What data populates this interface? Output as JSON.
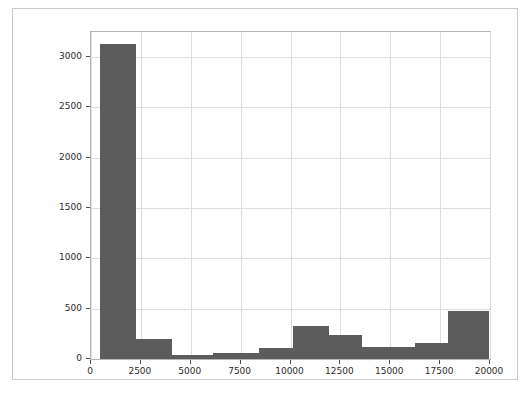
{
  "chart_data": {
    "type": "bar",
    "subtype": "histogram",
    "title": "",
    "subtitle": "",
    "xlabel": "",
    "ylabel": "",
    "xlim": [
      0,
      20000
    ],
    "ylim": [
      0,
      3250
    ],
    "grid": true,
    "legend": null,
    "bar_color": "#5c5c5c",
    "grid_color": "#dedede",
    "axes_color": "#b5b5b5",
    "background_color": "#ffffff",
    "xticks": [
      0,
      2500,
      5000,
      7500,
      10000,
      12500,
      15000,
      17500,
      20000
    ],
    "xtick_labels": [
      "0",
      "2500",
      "5000",
      "7500",
      "10000",
      "12500",
      "15000",
      "17500",
      "20000"
    ],
    "yticks": [
      0,
      500,
      1000,
      1500,
      2000,
      2500,
      3000
    ],
    "ytick_labels": [
      "0",
      "500",
      "1000",
      "1500",
      "2000",
      "2500",
      "3000"
    ],
    "bin_edges": [
      450,
      2250,
      4050,
      5000,
      6100,
      7350,
      8400,
      10150,
      11950,
      13600,
      15350,
      16250,
      17900,
      19950
    ],
    "bins": [
      {
        "x0": 450,
        "x1": 2250,
        "value": 3130
      },
      {
        "x0": 2250,
        "x1": 4050,
        "value": 200
      },
      {
        "x0": 4050,
        "x1": 6100,
        "value": 35
      },
      {
        "x0": 6100,
        "x1": 7350,
        "value": 55
      },
      {
        "x0": 7350,
        "x1": 8400,
        "value": 55
      },
      {
        "x0": 8400,
        "x1": 10150,
        "value": 105
      },
      {
        "x0": 10150,
        "x1": 11950,
        "value": 330
      },
      {
        "x0": 11950,
        "x1": 13600,
        "value": 240
      },
      {
        "x0": 13600,
        "x1": 15350,
        "value": 120
      },
      {
        "x0": 15350,
        "x1": 16250,
        "value": 120
      },
      {
        "x0": 16250,
        "x1": 17900,
        "value": 155
      },
      {
        "x0": 17900,
        "x1": 19950,
        "value": 475
      }
    ],
    "values": [
      3130,
      200,
      35,
      55,
      55,
      105,
      330,
      240,
      120,
      120,
      155,
      475
    ],
    "categories": [
      "450-2250",
      "2250-4050",
      "4050-6100",
      "6100-7350",
      "7350-8400",
      "8400-10150",
      "10150-11950",
      "11950-13600",
      "13600-15350",
      "15350-16250",
      "16250-17900",
      "17900-19950"
    ]
  }
}
